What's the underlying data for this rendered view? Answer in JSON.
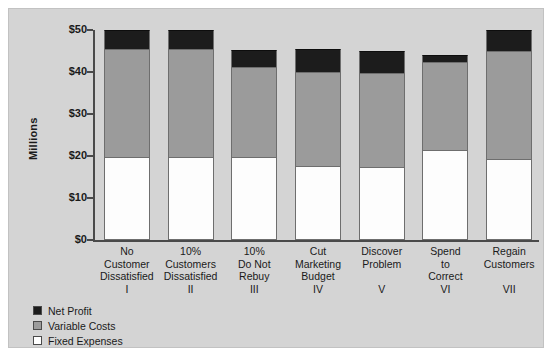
{
  "chart_data": {
    "type": "bar",
    "subtype": "stacked",
    "title": "",
    "xlabel": "",
    "ylabel": "Millions",
    "ylim": [
      0,
      50
    ],
    "ytick_values": [
      0,
      10,
      20,
      30,
      40,
      50
    ],
    "ytick_labels": [
      "$0",
      "$10",
      "$20",
      "$30",
      "$40",
      "$50"
    ],
    "grid": false,
    "legend_position": "below-left",
    "categories": [
      "No Customer Dissatisfied",
      "10% Customers Dissatisfied",
      "10% Do Not Rebuy",
      "Cut Marketing Budget",
      "Discover Problem",
      "Spend to Correct",
      "Regain Customers"
    ],
    "category_lines": [
      [
        "No",
        "Customer",
        "Dissatisfied"
      ],
      [
        "10%",
        "Customers",
        "Dissatisfied"
      ],
      [
        "10%",
        "Do Not",
        "Rebuy"
      ],
      [
        "Cut",
        "Marketing",
        "Budget"
      ],
      [
        "Discover",
        "Problem"
      ],
      [
        "Spend",
        "to",
        "Correct"
      ],
      [
        "Regain",
        "Customers"
      ]
    ],
    "category_numerals": [
      "I",
      "II",
      "III",
      "IV",
      "V",
      "VI",
      "VII"
    ],
    "series": [
      {
        "name": "Fixed Expenses",
        "color": "#ffffff",
        "values": [
          19.7,
          19.7,
          19.7,
          17.7,
          17.5,
          21.4,
          19.2
        ]
      },
      {
        "name": "Variable Costs",
        "color": "#9b9b9b",
        "values": [
          25.8,
          25.8,
          21.6,
          22.3,
          22.2,
          21.1,
          25.8
        ]
      },
      {
        "name": "Net Profit",
        "color": "#1c1c1c",
        "values": [
          4.5,
          4.5,
          4.0,
          5.5,
          5.3,
          1.5,
          5.0
        ]
      }
    ],
    "totals": [
      50.0,
      50.0,
      45.3,
      45.5,
      45.0,
      44.0,
      50.0
    ]
  },
  "legend": {
    "items": [
      {
        "label": "Net Profit",
        "swatch": "black"
      },
      {
        "label": "Variable Costs",
        "swatch": "gray"
      },
      {
        "label": "Fixed Expenses",
        "swatch": "white"
      }
    ]
  },
  "colors": {
    "figure_background": "#d4d4d4",
    "net_profit": "#1c1c1c",
    "variable_costs": "#9b9b9b",
    "fixed_expenses": "#ffffff",
    "axis": "#4a4a4a",
    "text": "#1a1a1a"
  }
}
